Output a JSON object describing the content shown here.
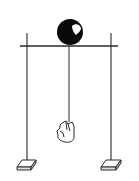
{
  "diagram": {
    "colors": {
      "background": "#ffffff",
      "line": "#2a2a2a",
      "ball": "#0a0a0a",
      "highlight": "#ffffff",
      "base_fill": "#f2f2f2"
    },
    "elements": {
      "crossbar": {
        "x1": 20,
        "y1": 46,
        "x2": 118,
        "y2": 46
      },
      "left_post": {
        "x": 27,
        "y1": 33,
        "y2": 163
      },
      "right_post": {
        "x": 111,
        "y1": 33,
        "y2": 163
      },
      "ball": {
        "cx": 70,
        "cy": 32,
        "r": 13
      },
      "cord": {
        "x": 69,
        "y1": 46,
        "y2": 121
      },
      "hanging_object": "hand",
      "left_base": {
        "x": 17,
        "y": 159
      },
      "right_base": {
        "x": 101,
        "y": 159
      }
    }
  }
}
